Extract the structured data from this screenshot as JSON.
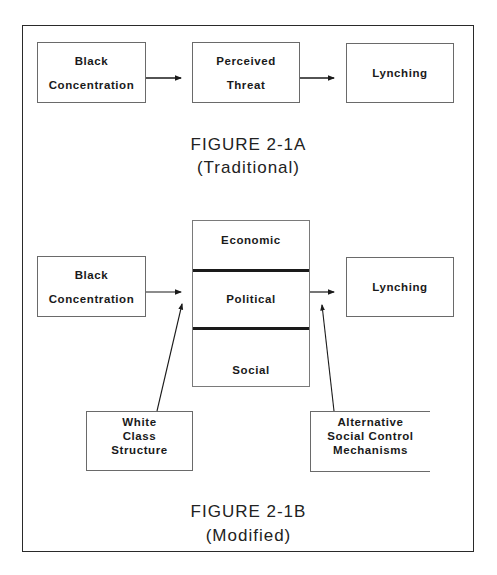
{
  "figure_a": {
    "boxes": [
      {
        "lines": [
          "Black",
          "Concentration"
        ]
      },
      {
        "lines": [
          "Perceived",
          "Threat"
        ]
      },
      {
        "lines": [
          "Lynching"
        ]
      }
    ],
    "title": "FIGURE 2-1A",
    "subtitle": "(Traditional)"
  },
  "figure_b": {
    "left_box": {
      "lines": [
        "Black",
        "Concentration"
      ]
    },
    "middle_stack": [
      "Economic",
      "Political",
      "Social"
    ],
    "right_box": {
      "lines": [
        "Lynching"
      ]
    },
    "bottom_left_box": {
      "lines": [
        "White",
        "Class",
        "Structure"
      ]
    },
    "bottom_right_box": {
      "lines": [
        "Alternative",
        "Social Control",
        "Mechanisms"
      ]
    },
    "title": "FIGURE 2-1B",
    "subtitle": "(Modified)"
  }
}
